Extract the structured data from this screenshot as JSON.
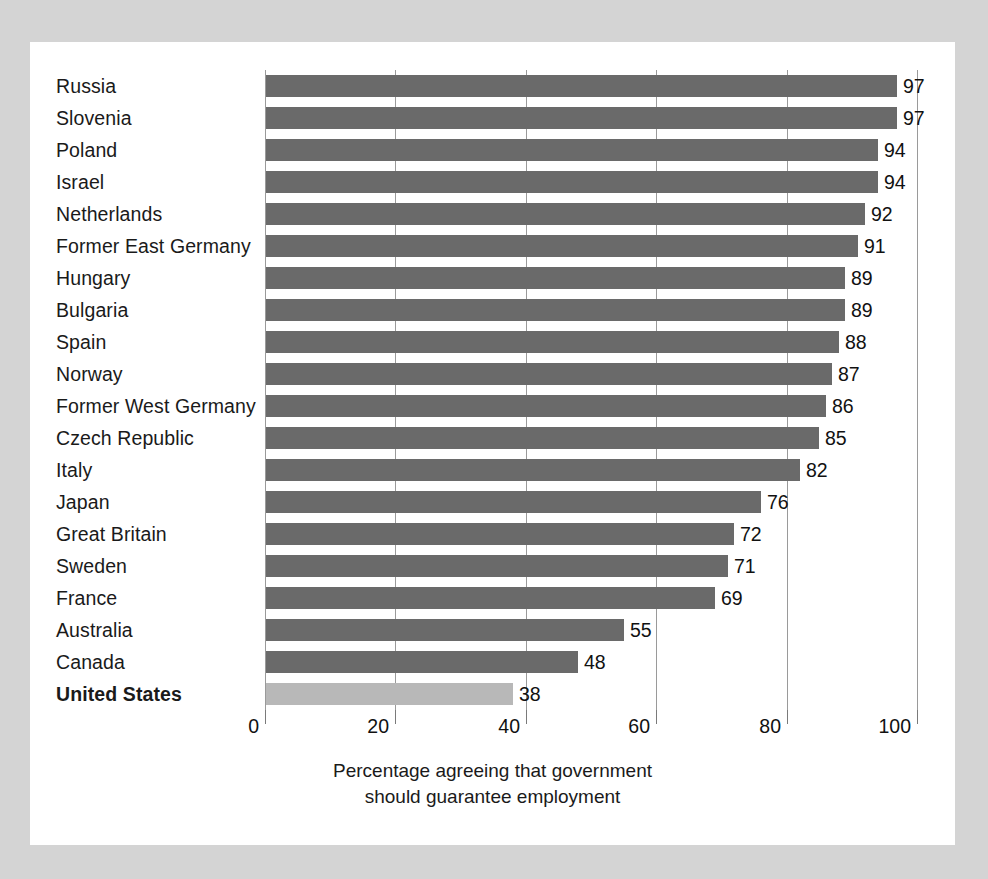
{
  "chart_data": {
    "type": "bar",
    "orientation": "horizontal",
    "title": "",
    "subtitle": "",
    "xlabel": "Percentage agreeing that government should guarantee employment",
    "ylabel": "",
    "xlim": [
      0,
      100
    ],
    "xticks": [
      0,
      20,
      40,
      60,
      80,
      100
    ],
    "xtick_labels": [
      "0",
      "20",
      "40",
      "60",
      "80",
      "100"
    ],
    "grid": true,
    "grid_axis": "x",
    "legend": false,
    "categories": [
      "Russia",
      "Slovenia",
      "Poland",
      "Israel",
      "Netherlands",
      "Former East Germany",
      "Hungary",
      "Bulgaria",
      "Spain",
      "Norway",
      "Former West Germany",
      "Czech Republic",
      "Italy",
      "Japan",
      "Great Britain",
      "Sweden",
      "France",
      "Australia",
      "Canada",
      "United States"
    ],
    "values": [
      97,
      97,
      94,
      94,
      92,
      91,
      89,
      89,
      88,
      87,
      86,
      85,
      82,
      76,
      72,
      71,
      69,
      55,
      48,
      38
    ],
    "value_labels": [
      "97",
      "97",
      "94",
      "94",
      "92",
      "91",
      "89",
      "89",
      "88",
      "87",
      "86",
      "85",
      "82",
      "76",
      "72",
      "71",
      "69",
      "55",
      "48",
      "38"
    ],
    "highlighted_category": "United States",
    "bar_color": "#6a6a6a",
    "highlight_bar_color": "#b8b8b8"
  },
  "caption": {
    "line1": "Percentage agreeing that government",
    "line2": "should guarantee employment"
  },
  "colors": {
    "page_background": "#d4d4d4",
    "panel_background": "#ffffff",
    "bar": "#6a6a6a",
    "bar_highlight": "#b8b8b8",
    "gridline": "#9a9a9a",
    "text": "#111111"
  }
}
